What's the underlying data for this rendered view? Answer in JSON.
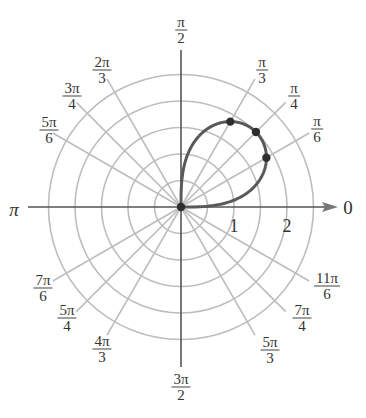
{
  "chart_data": {
    "type": "line",
    "subtype": "polar",
    "title": "",
    "equation_inferred": "r = 2*sqrt(sin(2θ)), 0 ≤ θ ≤ π/2",
    "radial_ticks": [
      1,
      2
    ],
    "radial_circles": [
      0.5,
      1,
      1.5,
      2,
      2.5
    ],
    "angle_labels": [
      {
        "num": "",
        "den": "",
        "text": "0",
        "theta_deg": 0
      },
      {
        "num": "π",
        "den": "6",
        "theta_deg": 30
      },
      {
        "num": "π",
        "den": "4",
        "theta_deg": 45
      },
      {
        "num": "π",
        "den": "3",
        "theta_deg": 60
      },
      {
        "num": "π",
        "den": "2",
        "theta_deg": 90
      },
      {
        "num": "2π",
        "den": "3",
        "theta_deg": 120
      },
      {
        "num": "3π",
        "den": "4",
        "theta_deg": 135
      },
      {
        "num": "5π",
        "den": "6",
        "theta_deg": 150
      },
      {
        "num": "",
        "den": "",
        "text": "π",
        "theta_deg": 180
      },
      {
        "num": "7π",
        "den": "6",
        "theta_deg": 210
      },
      {
        "num": "5π",
        "den": "4",
        "theta_deg": 225
      },
      {
        "num": "4π",
        "den": "3",
        "theta_deg": 240
      },
      {
        "num": "3π",
        "den": "2",
        "theta_deg": 270
      },
      {
        "num": "5π",
        "den": "3",
        "theta_deg": 300
      },
      {
        "num": "7π",
        "den": "4",
        "theta_deg": 315
      },
      {
        "num": "11π",
        "den": "6",
        "theta_deg": 330
      }
    ],
    "marked_points": [
      {
        "theta": "π/6",
        "r": 1.86
      },
      {
        "theta": "π/4",
        "r": 2.0
      },
      {
        "theta": "π/3",
        "r": 1.86
      },
      {
        "theta": "0",
        "r": 0
      }
    ],
    "grid": true,
    "colors": {
      "curve": "#595959",
      "grid": "#bdbdbd",
      "axis": "#555555"
    }
  },
  "labels": {
    "zero": "0",
    "pi": "π",
    "tick1": "1",
    "tick2": "2",
    "f_pi_2": {
      "num": "π",
      "den": "2"
    },
    "f_pi_3": {
      "num": "π",
      "den": "3"
    },
    "f_pi_4": {
      "num": "π",
      "den": "4"
    },
    "f_pi_6": {
      "num": "π",
      "den": "6"
    },
    "f_2pi_3": {
      "num": "2π",
      "den": "3"
    },
    "f_3pi_4": {
      "num": "3π",
      "den": "4"
    },
    "f_5pi_6": {
      "num": "5π",
      "den": "6"
    },
    "f_7pi_6": {
      "num": "7π",
      "den": "6"
    },
    "f_5pi_4": {
      "num": "5π",
      "den": "4"
    },
    "f_4pi_3": {
      "num": "4π",
      "den": "3"
    },
    "f_3pi_2": {
      "num": "3π",
      "den": "2"
    },
    "f_5pi_3": {
      "num": "5π",
      "den": "3"
    },
    "f_7pi_4": {
      "num": "7π",
      "den": "4"
    },
    "f_11pi_6": {
      "num": "11π",
      "den": "6"
    }
  }
}
